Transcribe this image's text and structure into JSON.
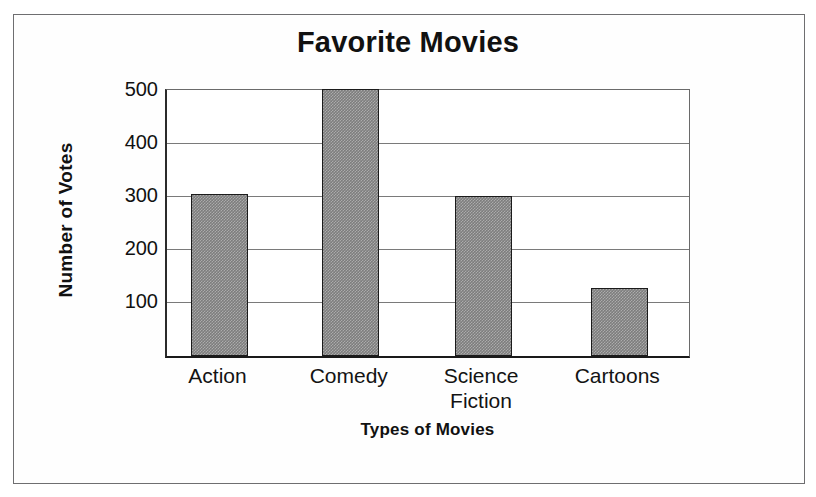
{
  "page": {
    "background_color": "#ffffff",
    "frame_color": "#6e6e70"
  },
  "chart_data": {
    "type": "bar",
    "title": "Favorite Movies",
    "xlabel": "Types of Movies",
    "ylabel": "Number of Votes",
    "categories": [
      "Action",
      "Comedy",
      "Science Fiction",
      "Cartoons"
    ],
    "category_lines": [
      [
        "Action"
      ],
      [
        "Comedy"
      ],
      [
        "Science",
        "Fiction"
      ],
      [
        "Cartoons"
      ]
    ],
    "values": [
      298,
      497,
      295,
      120
    ],
    "ylim": [
      0,
      500
    ],
    "yticks": [
      100,
      200,
      300,
      400,
      500
    ],
    "ytick_labels": [
      "100",
      "200",
      "300",
      "400",
      "500"
    ],
    "grid": "horizontal",
    "legend": "none",
    "bar_fill_color": "#7d7d7d",
    "bar_edge_color": "#1b1b1b",
    "gridline_color": "#7a7a7a",
    "axis_color": "#1a1a1a"
  }
}
